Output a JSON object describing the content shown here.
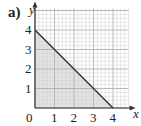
{
  "figure": {
    "part_label": "a)"
  },
  "chart_data": {
    "type": "area",
    "title": "",
    "xlabel": "x",
    "ylabel": "y",
    "xlim": [
      0,
      4.5
    ],
    "ylim": [
      0,
      5
    ],
    "grid": true,
    "grid_minor_step": 0.2,
    "grid_major_step": 1,
    "x_ticks": [
      "0",
      "1",
      "2",
      "3",
      "4"
    ],
    "y_ticks": [
      "1",
      "2",
      "3",
      "4"
    ],
    "series": [
      {
        "name": "line",
        "x": [
          0,
          4
        ],
        "y": [
          4,
          0
        ],
        "color": "#333333",
        "fill_below": true,
        "fill_color": "#d9d9d9"
      }
    ],
    "legend": null
  },
  "colors": {
    "grid_minor": "#d0d0d0",
    "grid_major": "#a8a8a8",
    "axis": "#333333",
    "shade": "#d9d9d9",
    "line": "#333333"
  }
}
